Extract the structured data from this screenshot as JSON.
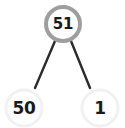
{
  "diagram": {
    "type": "number-bond",
    "parent": {
      "value": "51",
      "role": "whole",
      "state": "highlighted",
      "ring_color": "#9e9e9e",
      "fill_color": "#ffffff",
      "text_color": "#1a1a1a",
      "center_x": 63,
      "center_y": 24,
      "radius": 17,
      "ring_width": 4
    },
    "children": [
      {
        "value": "50",
        "role": "part",
        "state": "normal",
        "ring_color": "#f1f1f1",
        "fill_color": "#ffffff",
        "text_color": "#1a1a1a",
        "center_x": 24,
        "center_y": 108,
        "radius": 18,
        "ring_width": 3
      },
      {
        "value": "1",
        "role": "part",
        "state": "normal",
        "ring_color": "#f1f1f1",
        "fill_color": "#ffffff",
        "text_color": "#1a1a1a",
        "center_x": 100,
        "center_y": 108,
        "radius": 18,
        "ring_width": 3
      }
    ],
    "connectors": [
      {
        "name": "connector-left",
        "from": "51",
        "to": "50",
        "color": "#2b2b2b",
        "width": 2.4,
        "x1": 55,
        "y1": 41,
        "x2": 35,
        "y2": 88
      },
      {
        "name": "connector-right",
        "from": "51",
        "to": "1",
        "color": "#2b2b2b",
        "width": 2.4,
        "x1": 71,
        "y1": 41,
        "x2": 90,
        "y2": 88
      }
    ],
    "background": "#ffffff"
  }
}
